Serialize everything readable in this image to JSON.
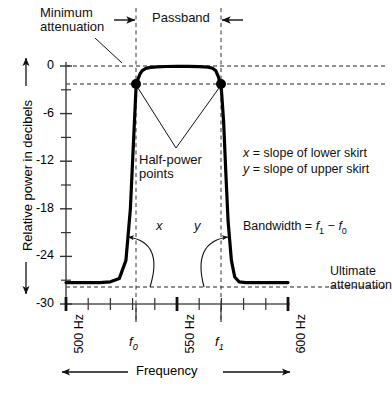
{
  "figure": {
    "axes": {
      "y_label": "Relative power in decibels",
      "x_label": "Frequency"
    }
  },
  "annotations": {
    "minimum_attenuation": "Minimum\nattenuation",
    "minimum_attenuation_line1": "Minimum",
    "minimum_attenuation_line2": "attenuation",
    "passband": "Passband",
    "half_power_line1": "Half-power",
    "half_power_line2": "points",
    "x_slope": "x = slope of lower skirt",
    "y_slope": "y = slope of upper skirt",
    "bandwidth": "Bandwidth = f1 − f0",
    "bandwidth_prefix": "Bandwidth = ",
    "ultimate_line1": "Ultimate",
    "ultimate_line2": "attenuation",
    "angle_x": "x",
    "angle_y": "y",
    "f0": "f",
    "f0_sub": "0",
    "f1": "f",
    "f1_sub": "1"
  },
  "chart_data": {
    "type": "line",
    "xlabel": "Frequency",
    "ylabel": "Relative power in decibels",
    "xlim": [
      500,
      600
    ],
    "ylim": [
      -30,
      0
    ],
    "xunit": "Hz",
    "yunit": "dB",
    "grid": false,
    "legend": "none",
    "x_major_ticks": [
      500,
      550,
      600
    ],
    "x_major_tick_labels": [
      "500 Hz",
      "550 Hz",
      "600 Hz"
    ],
    "x_minor_ticks": [
      510,
      520,
      530,
      540,
      560,
      570,
      580,
      590
    ],
    "y_major_ticks": [
      0,
      -6,
      -12,
      -18,
      -24,
      -30
    ],
    "y_major_tick_labels": [
      "0",
      "-6",
      "-12",
      "-18",
      "-24",
      "-30"
    ],
    "y_minor_ticks": [
      -3,
      -9,
      -15,
      -21,
      -27
    ],
    "markers": [
      {
        "name": "half-power point lower",
        "x": 531.5,
        "y": -3
      },
      {
        "name": "half-power point upper",
        "x": 570.0,
        "y": -3
      }
    ],
    "reference_lines": [
      {
        "name": "minimum attenuation",
        "orientation": "horizontal",
        "value": 0,
        "style": "dashed"
      },
      {
        "name": "half power -3 dB",
        "orientation": "horizontal",
        "value": -3,
        "style": "dashed"
      },
      {
        "name": "ultimate attenuation",
        "orientation": "horizontal",
        "value": -27.3,
        "style": "dashed"
      },
      {
        "name": "f0 cutoff",
        "orientation": "vertical",
        "value": 531.5,
        "style": "dashed"
      },
      {
        "name": "f1 cutoff",
        "orientation": "vertical",
        "value": 570.0,
        "style": "dashed"
      }
    ],
    "f0": 531.5,
    "f1": 570.0,
    "passband_range": [
      531.5,
      570.0
    ],
    "ultimate_attenuation_db": -27.3,
    "series": [
      {
        "name": "filter response",
        "x": [
          500,
          505,
          510,
          515,
          520,
          524,
          527,
          529,
          530.5,
          531.5,
          532.5,
          533.5,
          534.5,
          536,
          538,
          541,
          545,
          550,
          555,
          560,
          564,
          566,
          567.5,
          568.7,
          570,
          571,
          572,
          573,
          574.5,
          576,
          578,
          581,
          585,
          590,
          595,
          600
        ],
        "y": [
          -27.3,
          -27.3,
          -27.3,
          -27.3,
          -27.2,
          -26.8,
          -24.5,
          -18.0,
          -9.0,
          -3.0,
          -1.6,
          -0.9,
          -0.55,
          -0.3,
          -0.18,
          -0.1,
          -0.06,
          -0.05,
          -0.05,
          -0.07,
          -0.14,
          -0.28,
          -0.6,
          -1.4,
          -3.0,
          -7.0,
          -13.5,
          -19.5,
          -24.5,
          -26.6,
          -27.2,
          -27.3,
          -27.3,
          -27.3,
          -27.3,
          -27.3
        ]
      }
    ]
  }
}
